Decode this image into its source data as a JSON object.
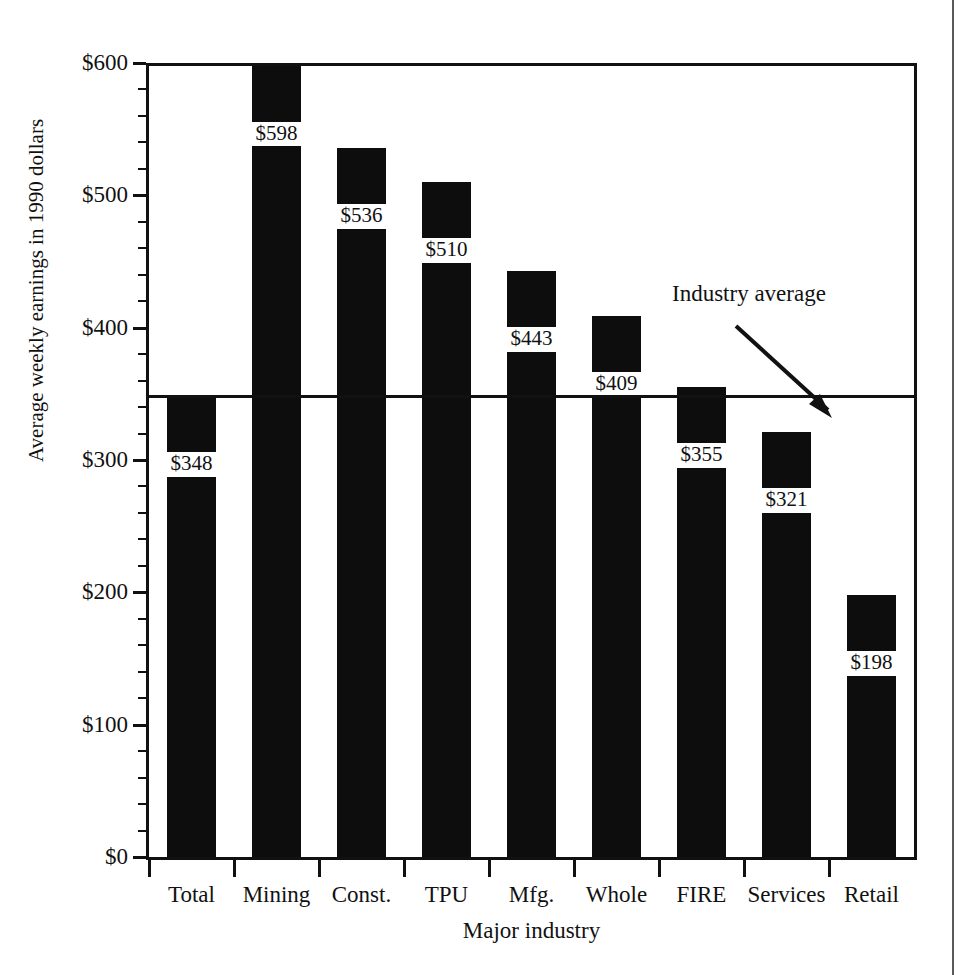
{
  "chart_data": {
    "type": "bar",
    "title": "",
    "subtitle": "",
    "xlabel": "Major industry",
    "ylabel": "Average weekly earnings in 1990 dollars",
    "categories": [
      "Total",
      "Mining",
      "Const.",
      "TPU",
      "Mfg.",
      "Whole",
      "FIRE",
      "Services",
      "Retail"
    ],
    "values": [
      348,
      598,
      536,
      510,
      443,
      409,
      355,
      321,
      198
    ],
    "value_labels": [
      "$348",
      "$598",
      "$536",
      "$510",
      "$443",
      "$409",
      "$355",
      "$321",
      "$198"
    ],
    "ylim": [
      0,
      600
    ],
    "y_major_ticks": [
      0,
      100,
      200,
      300,
      400,
      500,
      600
    ],
    "y_tick_labels": [
      "$0",
      "$100",
      "$200",
      "$300",
      "$400",
      "$500",
      "$600"
    ],
    "y_minor_tick_step": 20,
    "grid": false,
    "legend": null,
    "bar_color": "#0d0d0d",
    "axis_color": "#111111",
    "background_color": "#ffffff",
    "annotations": [
      {
        "text": "Industry average",
        "target_value": 348,
        "description": "arrow pointing to horizontal industry-average reference line"
      }
    ],
    "reference_line": {
      "label": "Industry average",
      "value": 348
    }
  },
  "axis": {
    "y_title": "Average weekly earnings in 1990 dollars",
    "x_title": "Major industry"
  },
  "annotation": {
    "industry_average_label": "Industry average"
  }
}
